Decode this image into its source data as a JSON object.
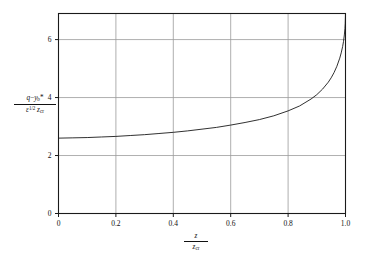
{
  "figure": {
    "background_color": "#ffffff",
    "frame_color": "#1a1a1a",
    "grid_color": "#9a9a9a",
    "curve_color": "#1a1a1a"
  },
  "axes": {
    "x": {
      "label_numerator": "z",
      "label_denominator_base": "z",
      "label_denominator_sub": "cr",
      "ticks": [
        "0",
        "0.2",
        "0.4",
        "0.6",
        "0.8",
        "1.0"
      ],
      "tick_values": [
        0,
        0.2,
        0.4,
        0.6,
        0.8,
        1.0
      ],
      "min": 0,
      "max": 1.0
    },
    "y": {
      "label_numerator_q": "q",
      "label_numerator_minus": "−",
      "label_numerator_y": "y",
      "label_numerator_y_sub": "b",
      "label_numerator_star": "*",
      "label_denominator_eps": "ε",
      "label_denominator_exp": "1/2",
      "label_denominator_z": "z",
      "label_denominator_z_sub": "cr",
      "ticks": [
        "0",
        "2",
        "4",
        "6"
      ],
      "tick_values": [
        0,
        2,
        4,
        6
      ],
      "min": 0,
      "max": 6.9
    }
  },
  "chart_data": {
    "type": "line",
    "title": "",
    "subtitle": "",
    "xlabel": "z / z_cr",
    "ylabel": "(q − y_b*) / (ε^(1/2) z_cr)",
    "xlim": [
      0,
      1.0
    ],
    "ylim": [
      0,
      6.9
    ],
    "xticks": [
      0,
      0.2,
      0.4,
      0.6,
      0.8,
      1.0
    ],
    "xticklabels": [
      "0",
      "0.2",
      "0.4",
      "0.6",
      "0.8",
      "1.0"
    ],
    "yticks": [
      0,
      2,
      4,
      6
    ],
    "yticklabels": [
      "0",
      "2",
      "4",
      "6"
    ],
    "grid": true,
    "legend": null,
    "annotations": [],
    "series": [
      {
        "name": "normalized discharge profile",
        "color": "#1a1a1a",
        "linewidth": 0.9,
        "x": [
          0.0,
          0.05,
          0.1,
          0.15,
          0.2,
          0.25,
          0.3,
          0.35,
          0.4,
          0.45,
          0.5,
          0.55,
          0.6,
          0.65,
          0.7,
          0.75,
          0.8,
          0.84,
          0.88,
          0.9,
          0.92,
          0.94,
          0.95,
          0.96,
          0.97,
          0.98,
          0.985,
          0.99,
          0.993,
          0.996,
          0.998,
          0.999,
          1.0
        ],
        "y": [
          2.6,
          2.61,
          2.62,
          2.64,
          2.66,
          2.69,
          2.72,
          2.76,
          2.8,
          2.85,
          2.91,
          2.97,
          3.05,
          3.14,
          3.24,
          3.37,
          3.54,
          3.71,
          3.95,
          4.1,
          4.29,
          4.53,
          4.68,
          4.86,
          5.08,
          5.36,
          5.54,
          5.76,
          5.93,
          6.16,
          6.38,
          6.55,
          6.9
        ]
      }
    ]
  }
}
